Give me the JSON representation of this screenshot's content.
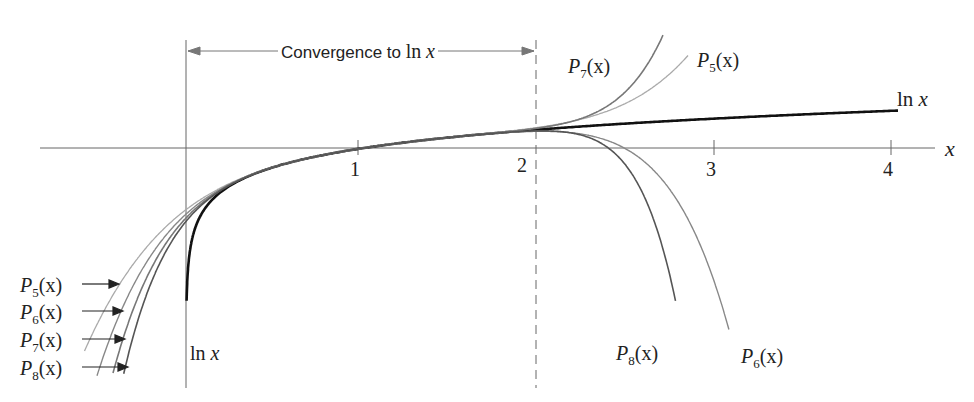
{
  "chart_data": {
    "type": "line",
    "title": "",
    "xlabel": "x",
    "ylabel": "",
    "xlim": [
      -0.6,
      4.4
    ],
    "ylim": [
      -8.3,
      5.4
    ],
    "x_ticks": [
      "1",
      "2",
      "3",
      "4"
    ],
    "grid": false,
    "legend": "inline labels",
    "annotation": "Convergence to ln x",
    "convergence_interval": [
      0,
      2
    ],
    "series": [
      {
        "name": "ln x",
        "function": "ln(x)",
        "domain": [
          0.004,
          4.0
        ],
        "color": "#111111"
      },
      {
        "name": "P5(x)",
        "function": "sum_{k=1..5} (-1)^(k+1)(x-1)^k/k",
        "color": "#aaaaaa"
      },
      {
        "name": "P6(x)",
        "function": "sum_{k=1..6} (-1)^(k+1)(x-1)^k/k",
        "color": "#888888"
      },
      {
        "name": "P7(x)",
        "function": "sum_{k=1..7} (-1)^(k+1)(x-1)^k/k",
        "color": "#777777"
      },
      {
        "name": "P8(x)",
        "function": "sum_{k=1..8} (-1)^(k+1)(x-1)^k/k",
        "color": "#555555"
      }
    ]
  },
  "labels": {
    "convergence": "Convergence to ln x",
    "conv_prefix": "Convergence to ",
    "conv_ln": "ln",
    "conv_x": "x",
    "x_axis": "x",
    "tick_1": "1",
    "tick_2": "2",
    "tick_3": "3",
    "tick_4": "4",
    "ln": "ln",
    "x": "x",
    "P": "P",
    "paren_x": "(x)",
    "s5": "5",
    "s6": "6",
    "s7": "7",
    "s8": "8"
  }
}
